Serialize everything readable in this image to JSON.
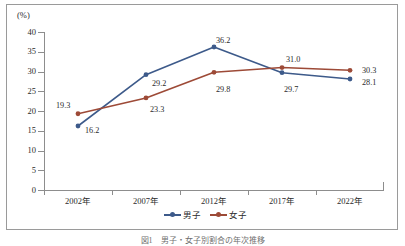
{
  "chart_data": {
    "type": "line",
    "title": "",
    "xlabel": "",
    "ylabel": "(%)",
    "unit_label": "(%)",
    "categories": [
      "2002年",
      "2007年",
      "2012年",
      "2017年",
      "2022年"
    ],
    "series": [
      {
        "name": "男子",
        "color": "#3d5a8a",
        "values": [
          16.2,
          29.2,
          36.2,
          29.7,
          28.1
        ],
        "labels": [
          "16.2",
          "29.2",
          "36.2",
          "29.7",
          "28.1"
        ]
      },
      {
        "name": "女子",
        "color": "#9d4a37",
        "values": [
          19.3,
          23.3,
          29.8,
          31.0,
          30.3
        ],
        "labels": [
          "19.3",
          "23.3",
          "29.8",
          "31.0",
          "30.3"
        ]
      }
    ],
    "ylim": [
      0,
      40
    ],
    "ystep": 5,
    "yticks": [
      "40",
      "35",
      "30",
      "25",
      "20",
      "15",
      "10",
      "5",
      "0"
    ],
    "grid": false,
    "legend_position": "bottom"
  },
  "legend": {
    "items": [
      {
        "label": "男子",
        "color": "#3d5a8a"
      },
      {
        "label": "女子",
        "color": "#9d4a37"
      }
    ]
  },
  "caption": "図1　男子・女子別割合の年次推移"
}
